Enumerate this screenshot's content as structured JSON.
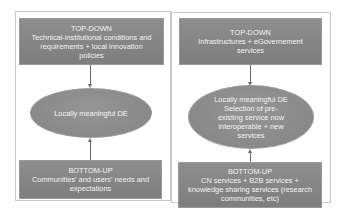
{
  "left_panel": {
    "top_box": {
      "title": "TOP-DOWN",
      "lines": [
        "Technical-institutional conditions and",
        "requirements + local innovation",
        "policies"
      ]
    },
    "ellipse": {
      "lines": [
        "Locally meaningful DE"
      ]
    },
    "bottom_box": {
      "title": "BOTTOM-UP",
      "lines": [
        "Communities' and users' needs and",
        "expectations"
      ]
    }
  },
  "right_panel": {
    "top_box": {
      "title": "TOP-DOWN",
      "lines": [
        "Infrastructures + eGovernement",
        "services"
      ]
    },
    "ellipse": {
      "lines": [
        "Locally meaningful DE",
        "Selection of pre-",
        "existing service now",
        "interoperable + new",
        "services"
      ]
    },
    "bottom_box": {
      "title": "BOTTOM-UP",
      "lines": [
        "CN services + B2B services +",
        "knowledge sharing services (research",
        "communities, etc)"
      ]
    }
  },
  "colors": {
    "box_fill": "#858585",
    "ellipse_fill": "#8c8c8c",
    "text": "#f4f4f4",
    "connector": "#6a6a6a",
    "frame_border": "#c8c8c8"
  }
}
